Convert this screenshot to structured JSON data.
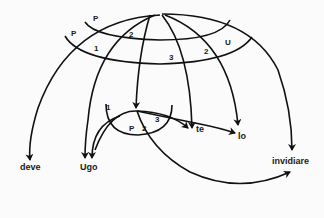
{
  "diagram": {
    "colors": {
      "stroke": "#111111",
      "background": "#fbfbfb",
      "text": "#1a1a1a"
    },
    "grid_labels": {
      "p_outer": "P",
      "p_inner": "P",
      "n1": "1",
      "n2_left": "2",
      "n3": "3",
      "n2_right": "2",
      "u": "U"
    },
    "inner_labels": {
      "n1": "1",
      "p": "P",
      "n2": "2",
      "n3": "3"
    },
    "targets": {
      "deve": "deve",
      "ugo": "Ugo",
      "te": "te",
      "lo": "lo",
      "invidiare": "invidiare"
    }
  }
}
